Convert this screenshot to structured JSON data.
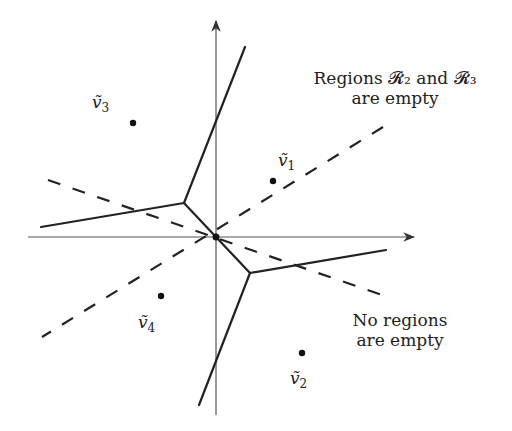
{
  "diagram": {
    "axes": {
      "origin": [
        216,
        237
      ],
      "x_end": 415,
      "x_start": 28,
      "y_top": 20,
      "y_bottom": 415
    },
    "annotations": {
      "top_right_line1": "Regions 𝓡₂ and 𝓡₃",
      "top_right_line2": "are empty",
      "bottom_right_line1": "No regions",
      "bottom_right_line2": "are empty"
    },
    "points": [
      {
        "name": "v1",
        "label": "ṽ",
        "sub": "1",
        "x": 273,
        "y": 181
      },
      {
        "name": "v2",
        "label": "ṽ",
        "sub": "2",
        "x": 302,
        "y": 353
      },
      {
        "name": "v3",
        "label": "ṽ",
        "sub": "3",
        "x": 133,
        "y": 123
      },
      {
        "name": "v4",
        "label": "ṽ",
        "sub": "4",
        "x": 161,
        "y": 296
      }
    ],
    "solid_lines": [
      [
        [
          216,
          237
        ],
        [
          184,
          203
        ]
      ],
      [
        [
          184,
          203
        ],
        [
          245,
          47
        ]
      ],
      [
        [
          184,
          203
        ],
        [
          41,
          227
        ]
      ],
      [
        [
          216,
          237
        ],
        [
          250,
          273
        ]
      ],
      [
        [
          250,
          273
        ],
        [
          386,
          250
        ]
      ],
      [
        [
          250,
          273
        ],
        [
          199,
          405
        ]
      ]
    ],
    "dashed_lines": [
      [
        [
          48,
          180
        ],
        [
          385,
          296
        ]
      ],
      [
        [
          383,
          127
        ],
        [
          42,
          337
        ]
      ]
    ]
  }
}
